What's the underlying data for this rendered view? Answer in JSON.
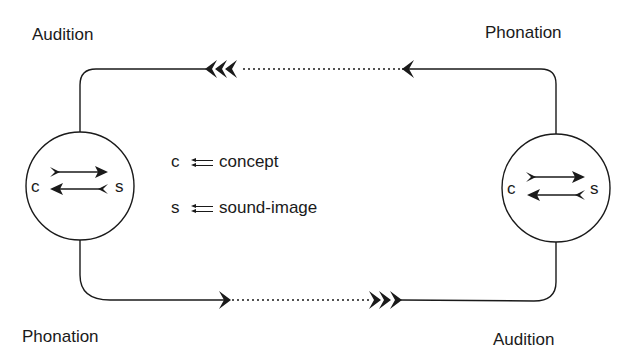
{
  "diagram": {
    "labels": {
      "top_left": "Audition",
      "top_right": "Phonation",
      "bottom_left": "Phonation",
      "bottom_right": "Audition"
    },
    "speakers": [
      {
        "id": "left",
        "concept_letter": "c",
        "sound_letter": "s"
      },
      {
        "id": "right",
        "concept_letter": "c",
        "sound_letter": "s"
      }
    ],
    "legend": [
      {
        "symbol": "c",
        "meaning": "concept"
      },
      {
        "symbol": "s",
        "meaning": "sound-image"
      }
    ],
    "colors": {
      "stroke": "#1a1a1a",
      "background": "#ffffff"
    }
  }
}
